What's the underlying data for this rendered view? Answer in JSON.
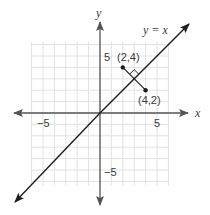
{
  "chart_data": {
    "type": "line",
    "title": "",
    "xlabel": "x",
    "ylabel": "y",
    "xlim": [
      -6,
      6
    ],
    "ylim": [
      -6,
      6
    ],
    "grid": true,
    "x_tick_labels": [
      {
        "value": -5,
        "label": "−5"
      },
      {
        "value": 5,
        "label": "5"
      }
    ],
    "y_tick_labels": [
      {
        "value": 5,
        "label": "5"
      },
      {
        "value": -5,
        "label": "−5"
      }
    ],
    "series": [
      {
        "name": "y = x",
        "kind": "line",
        "equation": "y = x",
        "label": "y = x",
        "arrows_both_ends": true
      },
      {
        "name": "perpendicular segment",
        "kind": "segment",
        "points": [
          [
            2,
            4
          ],
          [
            4,
            2
          ]
        ],
        "right_angle_marker_at": [
          3,
          3
        ]
      }
    ],
    "points": [
      {
        "x": 2,
        "y": 4,
        "label": "(2,4)"
      },
      {
        "x": 4,
        "y": 2,
        "label": "(4,2)"
      }
    ],
    "annotations": [
      "y = x",
      "(2,4)",
      "(4,2)"
    ]
  },
  "labels": {
    "x_axis": "x",
    "y_axis": "y",
    "line": "y = x",
    "x_neg5": "−5",
    "x_pos5": "5",
    "y_pos5": "5",
    "y_neg5": "−5",
    "point_a": "(2,4)",
    "point_b": "(4,2)"
  },
  "colors": {
    "axis": "#4a4a4a",
    "line": "#1e1e1e",
    "grid": "#e2e2e2",
    "text": "#3a3a3a"
  }
}
